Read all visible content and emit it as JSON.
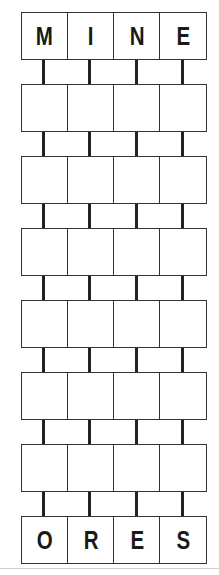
{
  "puzzle": {
    "type": "word-ladder",
    "columns": 4,
    "start_word": [
      "M",
      "I",
      "N",
      "E"
    ],
    "end_word": [
      "O",
      "R",
      "E",
      "S"
    ],
    "blank_rows": 6,
    "rows": [
      [
        "M",
        "I",
        "N",
        "E"
      ],
      [
        "",
        "",
        "",
        ""
      ],
      [
        "",
        "",
        "",
        ""
      ],
      [
        "",
        "",
        "",
        ""
      ],
      [
        "",
        "",
        "",
        ""
      ],
      [
        "",
        "",
        "",
        ""
      ],
      [
        "",
        "",
        "",
        ""
      ],
      [
        "O",
        "R",
        "E",
        "S"
      ]
    ]
  },
  "colors": {
    "border": "#333333",
    "connector": "#222222",
    "letter": "#1a1a1a",
    "background": "#ffffff"
  }
}
